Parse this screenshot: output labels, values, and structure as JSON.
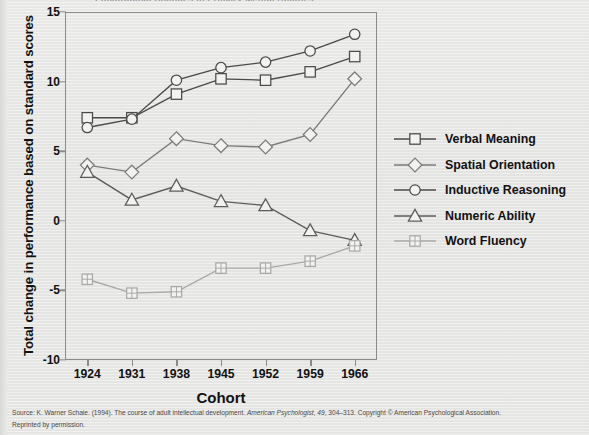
{
  "figure": {
    "title": "Longitudinal Changes in Primary Mental Abilities",
    "x_axis_title": "Cohort",
    "y_axis_title": "Total change in performance based on standard scores",
    "source_line1_a": "Source: K. Warner Schaie. (1994). The course of adult intellectual development. ",
    "source_line1_italic": "American Psychologist, 49",
    "source_line1_b": ", 304–313. Copyright © American Psychological Association.",
    "source_line2": "Reprinted by permission."
  },
  "chart_data": {
    "type": "line",
    "title": "Longitudinal Changes in Primary Mental Abilities",
    "xlabel": "Cohort",
    "ylabel": "Total change in performance based on standard scores",
    "categories": [
      "1924",
      "1931",
      "1938",
      "1945",
      "1952",
      "1959",
      "1966"
    ],
    "x": [
      1924,
      1931,
      1938,
      1945,
      1952,
      1959,
      1966
    ],
    "ylim": [
      -10,
      15
    ],
    "yticks": [
      15,
      10,
      5,
      0,
      -5,
      -10
    ],
    "ytick_labels": [
      "15",
      "10",
      "5",
      "0",
      "-5",
      "-10"
    ],
    "grid": false,
    "legend_position": "right",
    "series": [
      {
        "name": "Verbal Meaning",
        "marker": "square",
        "color": "#4a4a48",
        "values": [
          7.4,
          7.4,
          9.1,
          10.2,
          10.1,
          10.7,
          11.8
        ]
      },
      {
        "name": "Spatial Orientation",
        "marker": "diamond",
        "color": "#7b7b79",
        "values": [
          4.0,
          3.5,
          5.9,
          5.4,
          5.3,
          6.2,
          10.2
        ]
      },
      {
        "name": "Inductive Reasoning",
        "marker": "circle",
        "color": "#4a4a48",
        "values": [
          6.7,
          7.3,
          10.1,
          11.0,
          11.4,
          12.2,
          13.4
        ]
      },
      {
        "name": "Numeric Ability",
        "marker": "triangle",
        "color": "#5c5c5a",
        "values": [
          3.5,
          1.5,
          2.5,
          1.4,
          1.1,
          -0.7,
          -1.4
        ]
      },
      {
        "name": "Word Fluency",
        "marker": "crossed-square",
        "color": "#a9a9a7",
        "values": [
          -4.2,
          -5.2,
          -5.1,
          -3.4,
          -3.4,
          -2.9,
          -1.8
        ]
      }
    ]
  }
}
